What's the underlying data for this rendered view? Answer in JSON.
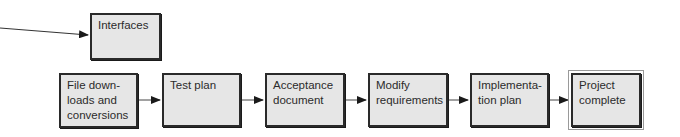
{
  "diagram": {
    "type": "flowchart",
    "side_input": {
      "label": "Interfaces"
    },
    "steps": [
      {
        "label": "File down-\nloads and\nconversions"
      },
      {
        "label": "Test plan"
      },
      {
        "label": "Acceptance\ndocument"
      },
      {
        "label": "Modify\nrequirements"
      },
      {
        "label": "Implementa-\ntion plan"
      },
      {
        "label": "Project\ncomplete"
      }
    ]
  }
}
